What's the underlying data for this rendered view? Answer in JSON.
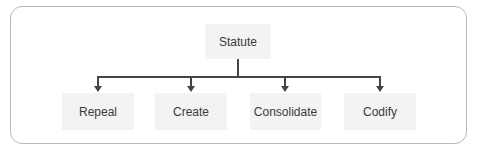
{
  "diagram": {
    "type": "tree",
    "root": {
      "label": "Statute"
    },
    "children": [
      {
        "label": "Repeal"
      },
      {
        "label": "Create"
      },
      {
        "label": "Consolidate"
      },
      {
        "label": "Codify"
      }
    ],
    "colors": {
      "frame_border": "#b8b8b8",
      "box_fill": "#f3f3f3",
      "connector": "#444444",
      "text": "#3a3a3a"
    }
  }
}
